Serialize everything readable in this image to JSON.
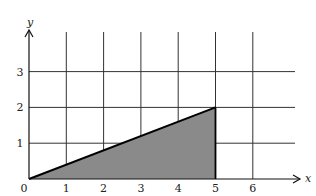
{
  "chart_data": {
    "type": "area",
    "title": "",
    "xlabel": "x",
    "ylabel": "y",
    "xlim": [
      0,
      6.9
    ],
    "ylim": [
      0,
      3.9
    ],
    "x_ticks": [
      0,
      1,
      2,
      3,
      4,
      5,
      6
    ],
    "y_ticks": [
      1,
      2,
      3
    ],
    "grid": true,
    "series": [
      {
        "name": "shaded triangle",
        "points": [
          [
            0,
            0
          ],
          [
            5,
            2
          ],
          [
            5,
            0
          ]
        ],
        "line": "y = 0.4x",
        "fill": "#8a8a8a"
      }
    ],
    "colors": {
      "grid": "#333333",
      "axis": "#111111",
      "fill": "#8a8a8a",
      "background": "#ffffff"
    }
  }
}
